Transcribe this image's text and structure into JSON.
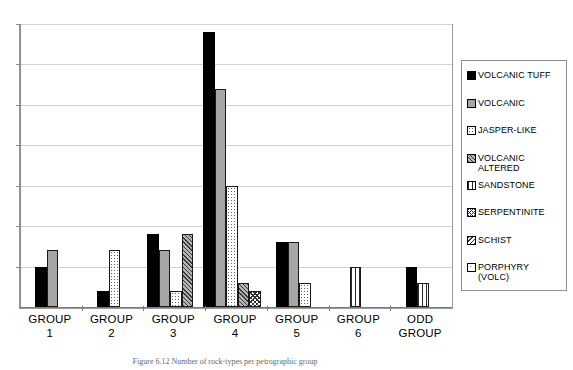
{
  "chart_data": {
    "type": "bar",
    "title": "",
    "xlabel": "",
    "ylabel": "",
    "categories": [
      "GROUP\n1",
      "GROUP\n2",
      "GROUP\n3",
      "GROUP\n4",
      "GROUP\n5",
      "GROUP\n6",
      "ODD\nGROUP"
    ],
    "ylim": [
      0,
      35
    ],
    "grid": true,
    "gridline_values": [
      5,
      10,
      15,
      20,
      25,
      30,
      35
    ],
    "legend_position": "right",
    "y_tick_labels_visible": false,
    "series": [
      {
        "name": "VOLCANIC TUFF",
        "pattern": "solid-black",
        "values": [
          5,
          2,
          9,
          34,
          8,
          0,
          5
        ]
      },
      {
        "name": "VOLCANIC",
        "pattern": "gray",
        "values": [
          7,
          0,
          7,
          27,
          8,
          0,
          0
        ]
      },
      {
        "name": "JASPER-LIKE",
        "pattern": "dots",
        "values": [
          0,
          7,
          2,
          15,
          3,
          0,
          0
        ]
      },
      {
        "name": "VOLCANIC ALTERED",
        "pattern": "diag-gray",
        "values": [
          0,
          0,
          9,
          3,
          0,
          0,
          0
        ]
      },
      {
        "name": "SANDSTONE",
        "pattern": "vertical",
        "values": [
          0,
          0,
          0,
          0,
          0,
          5,
          3
        ]
      },
      {
        "name": "SERPENTINITE",
        "pattern": "cross",
        "values": [
          0,
          0,
          0,
          2,
          0,
          0,
          0
        ]
      },
      {
        "name": "SCHIST",
        "pattern": "diag-dark",
        "values": [
          0,
          0,
          0,
          0,
          0,
          0,
          0
        ]
      },
      {
        "name": "PORPHYRY (VOLC)",
        "pattern": "sparse-dots",
        "values": [
          0,
          0,
          0,
          0,
          0,
          0,
          0
        ]
      }
    ]
  },
  "legend": {
    "items": [
      {
        "label": "VOLCANIC TUFF",
        "pattern": "solid-black"
      },
      {
        "label": "VOLCANIC",
        "pattern": "gray"
      },
      {
        "label": "JASPER-LIKE",
        "pattern": "dots"
      },
      {
        "label": "VOLCANIC\nALTERED",
        "pattern": "diag-gray"
      },
      {
        "label": "SANDSTONE",
        "pattern": "vertical"
      },
      {
        "label": "SERPENTINITE",
        "pattern": "cross"
      },
      {
        "label": "SCHIST",
        "pattern": "diag-dark"
      },
      {
        "label": "PORPHYRY\n(VOLC)",
        "pattern": "sparse-dots"
      }
    ]
  },
  "axis": {
    "x_labels": [
      "GROUP\n1",
      "GROUP\n2",
      "GROUP\n3",
      "GROUP\n4",
      "GROUP\n5",
      "GROUP\n6",
      "ODD\nGROUP"
    ]
  },
  "caption": {
    "text": "Figure 6.12 Number of rock-types per petrographic group"
  },
  "colors": {
    "bar_outline": "#1a1a1a",
    "solid_black": "#000000",
    "gray_fill": "#a6a6a6",
    "gridline": "#d2d2d2",
    "axis": "#8a8a8a",
    "legend_border": "#8f8f8f"
  }
}
